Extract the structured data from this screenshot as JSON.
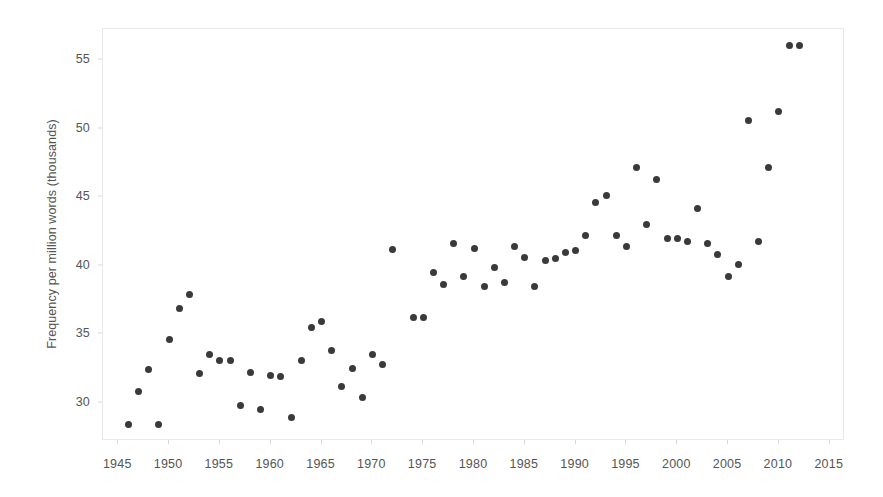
{
  "chart_data": {
    "type": "scatter",
    "title": "",
    "xlabel": "",
    "ylabel": "Frequency per million words (thousands)",
    "xlim": [
      1943.5,
      2016.5
    ],
    "ylim": [
      27.2,
      57.3
    ],
    "xticks": [
      1945,
      1950,
      1955,
      1960,
      1965,
      1970,
      1975,
      1980,
      1985,
      1990,
      1995,
      2000,
      2005,
      2010,
      2015
    ],
    "yticks": [
      30,
      35,
      40,
      45,
      50,
      55
    ],
    "grid": false,
    "legend": null,
    "marker_color": "#3a3a3a",
    "marker_size_px": 7,
    "series": [
      {
        "name": "Frequency per million words",
        "x": [
          1946,
          1947,
          1948,
          1949,
          1950,
          1951,
          1952,
          1953,
          1954,
          1955,
          1956,
          1957,
          1958,
          1959,
          1960,
          1961,
          1962,
          1963,
          1964,
          1965,
          1966,
          1967,
          1968,
          1969,
          1970,
          1971,
          1972,
          1974,
          1975,
          1976,
          1977,
          1978,
          1979,
          1980,
          1981,
          1982,
          1983,
          1984,
          1985,
          1986,
          1987,
          1988,
          1989,
          1990,
          1991,
          1992,
          1993,
          1994,
          1995,
          1996,
          1997,
          1998,
          1999,
          2000,
          2001,
          2002,
          2003,
          2004,
          2005,
          2006,
          2007,
          2008,
          2009,
          2010,
          2011,
          2012
        ],
        "y": [
          28.4,
          30.8,
          32.4,
          28.4,
          34.6,
          36.9,
          37.9,
          32.1,
          33.5,
          33.1,
          33.1,
          29.8,
          32.2,
          29.5,
          32.0,
          31.9,
          28.9,
          33.1,
          35.5,
          35.9,
          33.8,
          31.2,
          32.5,
          30.4,
          33.5,
          32.8,
          41.2,
          36.2,
          36.2,
          39.5,
          38.6,
          41.6,
          39.2,
          41.3,
          38.5,
          39.9,
          38.8,
          41.4,
          40.6,
          38.5,
          40.4,
          40.5,
          41.0,
          41.1,
          42.2,
          44.6,
          45.1,
          42.2,
          41.4,
          47.2,
          43.0,
          46.3,
          42.0,
          42.0,
          41.8,
          44.2,
          41.6,
          40.8,
          39.2,
          40.1,
          50.6,
          41.8,
          47.2,
          51.3,
          56.1,
          56.1
        ]
      }
    ]
  },
  "axes": {
    "y_title": "Frequency per million words (thousands)",
    "y_tick_labels": [
      "55",
      "50",
      "45",
      "40",
      "35",
      "30"
    ],
    "x_tick_labels": [
      "1945",
      "1950",
      "1955",
      "1960",
      "1965",
      "1970",
      "1975",
      "1980",
      "1985",
      "1990",
      "1995",
      "2000",
      "2005",
      "2010",
      "2015"
    ]
  },
  "colors": {
    "marker": "#3a3a3a",
    "axis_text": "#555555",
    "frame": "#e8e8e8",
    "background": "#ffffff"
  }
}
